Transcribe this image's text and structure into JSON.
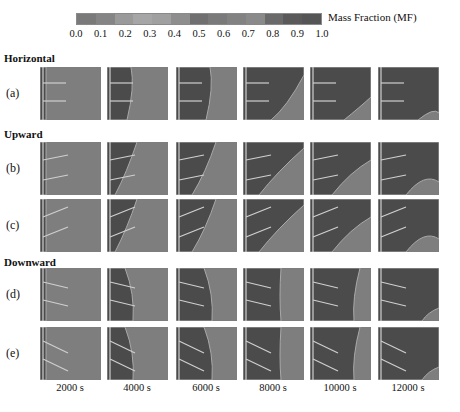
{
  "colorbar": {
    "label": "Mass Fraction (MF)",
    "ticks": [
      "0.0",
      "0.1",
      "0.2",
      "0.3",
      "0.4",
      "0.5",
      "0.6",
      "0.7",
      "0.8",
      "0.9",
      "1.0"
    ],
    "colors": [
      "#7a7a7a",
      "#858585",
      "#9a9a9a",
      "#a6a6a6",
      "#a0a0a0",
      "#8e8e8e",
      "#707070",
      "#7a7a7a",
      "#828282",
      "#8a8a8a",
      "#6a6a6a",
      "#5a5a5a",
      "#555555"
    ]
  },
  "groups": [
    {
      "label": "Horizontal",
      "top": 52
    },
    {
      "label": "Upward",
      "top": 128
    },
    {
      "label": "Downward",
      "top": 256
    }
  ],
  "rows": [
    {
      "label": "(a)",
      "top": 67,
      "orientation": "horizontal"
    },
    {
      "label": "(b)",
      "top": 142,
      "orientation": "upward"
    },
    {
      "label": "(c)",
      "top": 199,
      "orientation": "upward2"
    },
    {
      "label": "(d)",
      "top": 268,
      "orientation": "downward"
    },
    {
      "label": "(e)",
      "top": 327,
      "orientation": "downward2"
    }
  ],
  "columns": [
    {
      "time": "2000 s",
      "left": 40
    },
    {
      "time": "4000 s",
      "left": 107
    },
    {
      "time": "6000 s",
      "left": 176
    },
    {
      "time": "8000 s",
      "left": 243
    },
    {
      "time": "10000 s",
      "left": 310
    },
    {
      "time": "12000 s",
      "left": 378
    }
  ],
  "palette": {
    "liquid": "#7e7e7e",
    "solid": "#4b4b4b",
    "interface": "#a9a9a9",
    "fin": "#cfcfcf"
  }
}
